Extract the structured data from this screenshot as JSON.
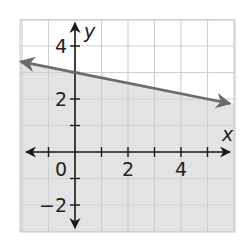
{
  "chart_data": {
    "type": "line",
    "title": "",
    "xlabel": "x",
    "ylabel": "y",
    "xlim": [
      -2,
      6
    ],
    "ylim": [
      -3,
      5
    ],
    "grid": true,
    "grid_step": 1,
    "x_ticks": [
      2,
      4
    ],
    "x_tick_labels": [
      "2",
      "4"
    ],
    "y_ticks": [
      -2,
      2,
      4
    ],
    "y_tick_labels": [
      "−2",
      "2",
      "4"
    ],
    "origin_label": "0",
    "series": [
      {
        "name": "boundary line",
        "equation": "y = -0.2x + 3",
        "slope": -0.2,
        "intercept": 3,
        "line_style": "solid",
        "arrows": "both",
        "points": [
          {
            "x": -2,
            "y": 3.4
          },
          {
            "x": 0,
            "y": 3
          },
          {
            "x": 5,
            "y": 2
          },
          {
            "x": 5.9,
            "y": 1.82
          }
        ]
      }
    ],
    "shaded_region": {
      "description": "half-plane below the boundary line",
      "inequality": "y <= -0.2x + 3"
    },
    "colors": {
      "grid": "#cfcfcf",
      "shade": "#e3e3e3",
      "line": "#6b6b6b",
      "axes": "#1a1a1a",
      "background": "#ffffff"
    }
  }
}
